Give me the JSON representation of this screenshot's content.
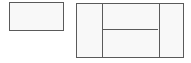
{
  "diagram": {
    "type": "line-diagram",
    "background_color": "#ffffff",
    "fill_color": "#f8f8f8",
    "line_color": "#5a5a5a",
    "line_width_px": 1,
    "canvas": {
      "width": 191,
      "height": 63
    },
    "shapes": [
      {
        "id": "shape-left",
        "name": "left-rectangle",
        "label": "",
        "x": 9,
        "y": 2,
        "width": 55,
        "height": 29,
        "subdivisions": 0
      },
      {
        "id": "shape-right",
        "name": "right-rectangle",
        "label": "",
        "x": 76,
        "y": 3,
        "width": 108,
        "height": 55,
        "subdivisions": 4,
        "columns": [
          {
            "id": "col-left",
            "name": "left-column",
            "label": "",
            "width": 25
          },
          {
            "id": "col-middle",
            "name": "middle-column",
            "label": "",
            "width": 57,
            "rows": [
              {
                "id": "cell-middle-top",
                "name": "middle-top-cell",
                "label": "",
                "height": 25
              },
              {
                "id": "cell-middle-bottom",
                "name": "middle-bottom-cell",
                "label": "",
                "height": 28
              }
            ]
          },
          {
            "id": "col-right",
            "name": "right-column",
            "label": "",
            "width": 24
          }
        ],
        "dividers": [
          {
            "id": "divider-v-left",
            "name": "vertical-divider-left",
            "orientation": "vertical",
            "offset": 25
          },
          {
            "id": "divider-v-right",
            "name": "vertical-divider-right",
            "orientation": "vertical",
            "offset": 82
          },
          {
            "id": "divider-h-mid",
            "name": "horizontal-divider-mid",
            "orientation": "horizontal",
            "offset": 25
          }
        ]
      }
    ]
  }
}
